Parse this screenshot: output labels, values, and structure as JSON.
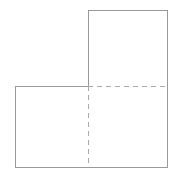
{
  "figure": {
    "type": "geometric-diagram",
    "background_color": "#ffffff",
    "canvas": {
      "width": 180,
      "height": 179
    },
    "outline": {
      "name": "l-shape-outline",
      "stroke_color": "#999999",
      "stroke_width": 1,
      "style": "solid",
      "points": [
        [
          88,
          10
        ],
        [
          167,
          10
        ],
        [
          167,
          167
        ],
        [
          15,
          167
        ],
        [
          15,
          86
        ],
        [
          88,
          86
        ]
      ],
      "path": "M 88 10 L 167 10 L 167 167 L 15 167 L 15 86 L 88 86 Z"
    },
    "dividers": [
      {
        "name": "horizontal-divider",
        "orientation": "horizontal",
        "stroke_color": "#aaaaaa",
        "stroke_width": 1,
        "style": "dashed",
        "dash_pattern": "5,4",
        "from": [
          88,
          86
        ],
        "to": [
          167,
          86
        ],
        "path": "M 88 86 L 167 86"
      },
      {
        "name": "vertical-divider",
        "orientation": "vertical",
        "stroke_color": "#aaaaaa",
        "stroke_width": 1,
        "style": "dashed",
        "dash_pattern": "5,4",
        "from": [
          88,
          86
        ],
        "to": [
          88,
          167
        ],
        "path": "M 88 86 L 88 167"
      }
    ],
    "cells": [
      {
        "name": "top-right-square",
        "x": 88,
        "y": 10,
        "width": 79,
        "height": 76
      },
      {
        "name": "bottom-left-square",
        "x": 15,
        "y": 86,
        "width": 73,
        "height": 81
      },
      {
        "name": "bottom-right-square",
        "x": 88,
        "y": 86,
        "width": 79,
        "height": 81
      }
    ]
  }
}
